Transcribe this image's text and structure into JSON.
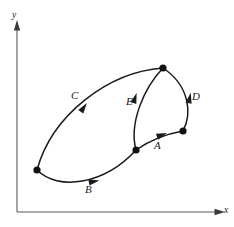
{
  "figure": {
    "kind": "oriented-region-diagram",
    "background_color": "#ffffff",
    "curve_color": "#1a1a1a",
    "axis_color": "#5a5a5a",
    "node_color": "#111111",
    "width": 234,
    "height": 227
  },
  "axes": {
    "x_label": "x",
    "y_label": "y",
    "origin": {
      "x": 17,
      "y": 212
    },
    "x_axis_end": {
      "x": 218,
      "y": 212
    },
    "y_axis_end": {
      "x": 17,
      "y": 27
    },
    "x_label_pos": {
      "x": 224,
      "y": 206
    },
    "y_label_pos": {
      "x": 12,
      "y": 11
    }
  },
  "nodes": [
    {
      "id": "left",
      "name": "vertex-left",
      "x": 37,
      "y": 170
    },
    {
      "id": "top",
      "name": "vertex-top",
      "x": 163,
      "y": 68
    },
    {
      "id": "mid",
      "name": "vertex-bottom-mid",
      "x": 136,
      "y": 150
    },
    {
      "id": "right",
      "name": "vertex-right",
      "x": 183,
      "y": 131
    }
  ],
  "curves": [
    {
      "id": "A",
      "label": "A",
      "from": "mid",
      "to": "right",
      "orientation": "rightward",
      "path": "M 136 150 C 146 143 160 135 183 131",
      "label_pos": {
        "x": 154,
        "y": 140
      },
      "arrow_at": {
        "x": 159,
        "y": 136
      },
      "arrow_angle": -20
    },
    {
      "id": "B",
      "label": "B",
      "from": "left",
      "to": "mid",
      "orientation": "rightward",
      "path": "M 37 170 C 58 191 104 185 136 150",
      "label_pos": {
        "x": 85,
        "y": 184
      },
      "arrow_at": {
        "x": 91,
        "y": 182
      },
      "arrow_angle": -10
    },
    {
      "id": "C",
      "label": "C",
      "from": "left",
      "to": "top",
      "orientation": "up-right",
      "path": "M 37 170 C 52 115 108 72 163 68",
      "label_pos": {
        "x": 71,
        "y": 90
      },
      "arrow_at": {
        "x": 82,
        "y": 110
      },
      "arrow_angle": -55
    },
    {
      "id": "D",
      "label": "D",
      "from": "right",
      "to": "top",
      "orientation": "upward",
      "path": "M 183 131 C 192 114 190 86 163 68",
      "label_pos": {
        "x": 192,
        "y": 91
      },
      "arrow_at": {
        "x": 189,
        "y": 101
      },
      "arrow_angle": -78
    },
    {
      "id": "E",
      "label": "E",
      "from": "mid",
      "to": "top",
      "orientation": "upward",
      "path": "M 136 150 C 129 124 143 89 163 68",
      "label_pos": {
        "x": 126,
        "y": 96
      },
      "arrow_at": {
        "x": 134,
        "y": 101
      },
      "arrow_angle": -72
    }
  ]
}
